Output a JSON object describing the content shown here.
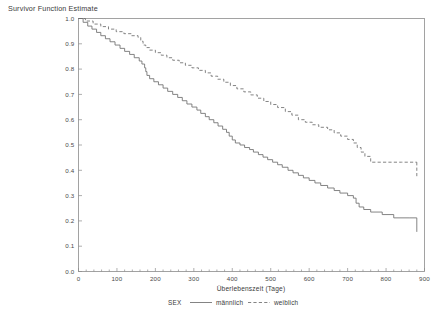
{
  "chart_data": {
    "type": "line",
    "title": "",
    "ylabel": "Survivor Function Estimate",
    "xlabel": "Überlebenszeit (Tage)",
    "xlim": [
      0,
      900
    ],
    "ylim": [
      0.0,
      1.0
    ],
    "xticks": [
      "0",
      "100",
      "200",
      "300",
      "400",
      "500",
      "600",
      "700",
      "800",
      "900"
    ],
    "xtick_values": [
      0,
      100,
      200,
      300,
      400,
      500,
      600,
      700,
      800,
      900
    ],
    "yticks": [
      "0.0",
      "0.1",
      "0.2",
      "0.3",
      "0.4",
      "0.5",
      "0.6",
      "0.7",
      "0.8",
      "0.9",
      "1.0"
    ],
    "ytick_values": [
      0.0,
      0.1,
      0.2,
      0.3,
      0.4,
      0.5,
      0.6,
      0.7,
      0.8,
      0.9,
      1.0
    ],
    "grid": false,
    "legend_position": "bottom",
    "legend_title": "SEX",
    "series": [
      {
        "name": "männlich",
        "style": "solid",
        "color": "#6e6e6e",
        "x": [
          0,
          12,
          24,
          35,
          47,
          58,
          70,
          82,
          95,
          108,
          120,
          133,
          145,
          158,
          165,
          172,
          175,
          178,
          185,
          196,
          208,
          220,
          232,
          245,
          258,
          270,
          282,
          295,
          308,
          318,
          330,
          340,
          352,
          363,
          375,
          385,
          392,
          400,
          408,
          420,
          432,
          445,
          455,
          468,
          480,
          492,
          505,
          518,
          530,
          545,
          558,
          572,
          585,
          600,
          615,
          630,
          648,
          665,
          680,
          700,
          715,
          722,
          730,
          742,
          760,
          790,
          820,
          860,
          880
        ],
        "y": [
          1.0,
          0.985,
          0.97,
          0.958,
          0.945,
          0.932,
          0.92,
          0.908,
          0.895,
          0.882,
          0.87,
          0.858,
          0.845,
          0.832,
          0.82,
          0.805,
          0.79,
          0.775,
          0.762,
          0.75,
          0.738,
          0.725,
          0.712,
          0.7,
          0.688,
          0.675,
          0.662,
          0.65,
          0.638,
          0.625,
          0.612,
          0.6,
          0.588,
          0.575,
          0.562,
          0.55,
          0.535,
          0.52,
          0.508,
          0.5,
          0.49,
          0.482,
          0.472,
          0.462,
          0.452,
          0.442,
          0.432,
          0.422,
          0.412,
          0.4,
          0.39,
          0.38,
          0.37,
          0.36,
          0.35,
          0.34,
          0.33,
          0.32,
          0.31,
          0.3,
          0.29,
          0.27,
          0.255,
          0.245,
          0.235,
          0.225,
          0.212,
          0.212,
          0.212
        ]
      },
      {
        "name": "weiblich",
        "style": "dashed",
        "color": "#6e6e6e",
        "x": [
          0,
          18,
          38,
          58,
          78,
          98,
          118,
          138,
          155,
          162,
          168,
          175,
          185,
          200,
          215,
          230,
          245,
          262,
          278,
          295,
          312,
          330,
          345,
          362,
          378,
          395,
          412,
          430,
          448,
          465,
          482,
          500,
          518,
          538,
          555,
          572,
          590,
          608,
          625,
          648,
          665,
          682,
          700,
          715,
          725,
          735,
          745,
          760,
          800,
          840,
          880
        ],
        "y": [
          1.0,
          0.99,
          0.978,
          0.968,
          0.958,
          0.948,
          0.94,
          0.932,
          0.925,
          0.91,
          0.895,
          0.885,
          0.875,
          0.865,
          0.855,
          0.845,
          0.835,
          0.825,
          0.815,
          0.805,
          0.795,
          0.785,
          0.772,
          0.76,
          0.748,
          0.735,
          0.722,
          0.71,
          0.698,
          0.685,
          0.672,
          0.66,
          0.648,
          0.632,
          0.618,
          0.6,
          0.59,
          0.58,
          0.57,
          0.56,
          0.548,
          0.535,
          0.522,
          0.508,
          0.49,
          0.472,
          0.455,
          0.432,
          0.432,
          0.432,
          0.432
        ]
      }
    ],
    "annotations": [
      {
        "label": "männlich plateau",
        "value": 0.212
      },
      {
        "label": "weiblich plateau",
        "value": 0.432
      }
    ]
  }
}
